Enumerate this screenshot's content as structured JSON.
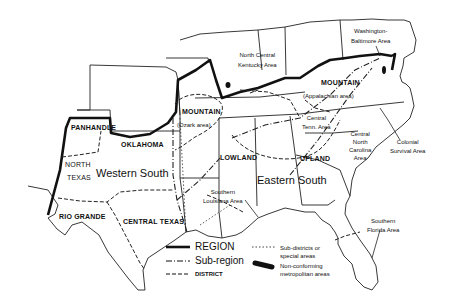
{
  "map": {
    "regions": [
      {
        "name": "Western South",
        "x": 96,
        "y": 168
      },
      {
        "name": "Eastern South",
        "x": 257,
        "y": 175
      }
    ],
    "subregions": [
      {
        "name": "PANHANDLE",
        "x": 71,
        "y": 124
      },
      {
        "name": "OKLAHOMA",
        "x": 121,
        "y": 141
      },
      {
        "name": "MOUNTAIN",
        "x": 182,
        "y": 108
      },
      {
        "name": "MOUNTAIN",
        "x": 321,
        "y": 79
      },
      {
        "name": "LOWLAND",
        "x": 220,
        "y": 154
      },
      {
        "name": "UPLAND",
        "x": 300,
        "y": 155
      },
      {
        "name": "NORTH",
        "x": 65,
        "y": 161
      },
      {
        "name": "TEXAS",
        "x": 67,
        "y": 174
      },
      {
        "name": "RIO GRANDE",
        "x": 59,
        "y": 213
      },
      {
        "name": "CENTRAL TEXAS",
        "x": 123,
        "y": 218
      }
    ],
    "areas": [
      {
        "lines": [
          "(Ozark area)"
        ],
        "x": 177,
        "y": 122
      },
      {
        "lines": [
          "North Central",
          "Kentucky Area"
        ],
        "x": 238,
        "y": 52
      },
      {
        "lines": [
          "Washington-",
          "Baltimore Area"
        ],
        "x": 351,
        "y": 28
      },
      {
        "lines": [
          "(Appalachian area)"
        ],
        "x": 303,
        "y": 93
      },
      {
        "lines": [
          "Central",
          "Tenn. Area"
        ],
        "x": 302,
        "y": 115
      },
      {
        "lines": [
          "Central",
          "North",
          "Carolina",
          "Area"
        ],
        "x": 349,
        "y": 131
      },
      {
        "lines": [
          "Colonial",
          "Survival Area"
        ],
        "x": 390,
        "y": 139
      },
      {
        "lines": [
          "Southern",
          "Louisiana Area"
        ],
        "x": 203,
        "y": 189
      },
      {
        "lines": [
          "Southern",
          "Florida Area"
        ],
        "x": 367,
        "y": 218
      }
    ],
    "legend": {
      "items": [
        {
          "style": "region",
          "label": "REGION"
        },
        {
          "style": "subregion",
          "label": "Sub-region"
        },
        {
          "style": "district",
          "label": "DISTRICT"
        },
        {
          "style": "subdistrict",
          "label": "Sub-districts or special areas"
        },
        {
          "style": "metro",
          "label": "Non-conforming metropolitan areas"
        }
      ]
    },
    "colors": {
      "ink": "#111111",
      "paper": "#ffffff"
    }
  }
}
